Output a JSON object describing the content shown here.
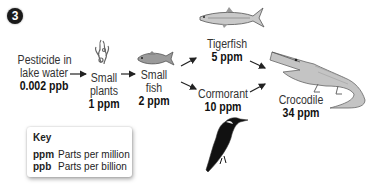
{
  "figure_number": "3",
  "nodes": [
    {
      "id": "water",
      "label": "Pesticide in\nlake water",
      "label_line1": "Pesticide in",
      "label_line2": "lake water",
      "value": "0.002 ppb",
      "icon": "none"
    },
    {
      "id": "small_plants",
      "label_line1": "Small",
      "label_line2": "plants",
      "value": "1 ppm",
      "icon": "plant-icon"
    },
    {
      "id": "small_fish",
      "label_line1": "Small",
      "label_line2": "fish",
      "value": "2 ppm",
      "icon": "small-fish-icon"
    },
    {
      "id": "tigerfish",
      "label_line1": "Tigerfish",
      "value": "5 ppm",
      "icon": "tigerfish-icon"
    },
    {
      "id": "cormorant",
      "label_line1": "Cormorant",
      "value": "10 ppm",
      "icon": "cormorant-icon"
    },
    {
      "id": "crocodile",
      "label_line1": "Crocodile",
      "value": "34 ppm",
      "icon": "crocodile-icon"
    }
  ],
  "edges": [
    {
      "from": "water",
      "to": "small_plants"
    },
    {
      "from": "small_plants",
      "to": "small_fish"
    },
    {
      "from": "small_fish",
      "to": "tigerfish"
    },
    {
      "from": "small_fish",
      "to": "cormorant"
    },
    {
      "from": "tigerfish",
      "to": "crocodile"
    },
    {
      "from": "cormorant",
      "to": "crocodile"
    }
  ],
  "key": {
    "title": "Key",
    "entries": [
      {
        "abbr": "ppm",
        "meaning": "Parts per million"
      },
      {
        "abbr": "ppb",
        "meaning": "Parts per billion"
      }
    ]
  }
}
